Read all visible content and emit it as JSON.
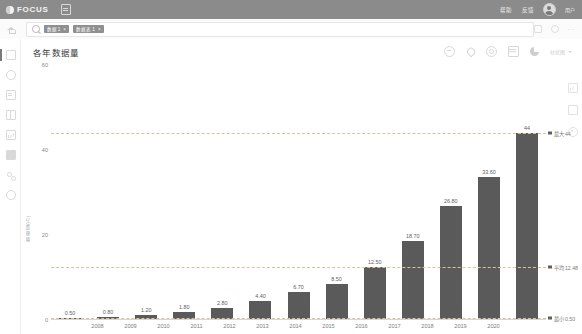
{
  "header": {
    "logo_text": "FOCUS",
    "logo_icon": "focus-circle-logo",
    "doc_icon": "document-icon",
    "links": [
      "帮助",
      "反馈"
    ],
    "user_name": "用户"
  },
  "subbar": {
    "home_icon": "home-icon",
    "search_icon": "search-icon",
    "search_placeholder": "搜索",
    "chips": [
      {
        "label": "数据 1",
        "close": "×"
      },
      {
        "label": "数据表 1",
        "close": "×"
      }
    ],
    "right_icons": [
      "square-icon",
      "circle-icon",
      "more-dots-icon"
    ]
  },
  "sidebar": {
    "items": [
      {
        "name": "sidebar-item-home",
        "icon": "square-icon",
        "active": true
      },
      {
        "name": "sidebar-item-circle",
        "icon": "circle-icon",
        "active": false
      },
      {
        "name": "sidebar-item-document",
        "icon": "document-icon",
        "active": false
      },
      {
        "name": "sidebar-item-grid",
        "icon": "grid-icon",
        "active": false
      },
      {
        "name": "sidebar-item-chart",
        "icon": "bar-chart-icon",
        "active": false
      },
      {
        "name": "sidebar-item-database",
        "icon": "database-icon",
        "active": false
      },
      {
        "name": "sidebar-item-share",
        "icon": "share-icon",
        "active": false
      },
      {
        "name": "sidebar-item-settings",
        "icon": "gear-icon",
        "active": false
      }
    ]
  },
  "card": {
    "title": "各年数据量",
    "tools": [
      {
        "name": "collapse-button",
        "icon": "minus-circle-icon"
      },
      {
        "name": "pin-button",
        "icon": "pin-icon"
      },
      {
        "name": "refresh-button",
        "icon": "refresh-icon"
      },
      {
        "name": "table-view-button",
        "icon": "table-icon"
      },
      {
        "name": "chart-type-button",
        "icon": "pie-chart-icon"
      }
    ],
    "type_selector_label": "柱状图",
    "right_rail": [
      {
        "name": "rail-chart-icon",
        "icon": "bar-chart-icon"
      },
      {
        "name": "rail-square-icon",
        "icon": "square-icon"
      },
      {
        "name": "rail-target-icon",
        "icon": "target-icon"
      }
    ]
  },
  "chart_data": {
    "type": "bar",
    "title": "各年数据量",
    "xlabel": "年份",
    "ylabel": "数据量(万)",
    "categories": [
      "2008",
      "2009",
      "2010",
      "2011",
      "2012",
      "2013",
      "2014",
      "2015",
      "2016",
      "2017",
      "2018",
      "2019",
      "2020"
    ],
    "values": [
      0.5,
      0.8,
      1.2,
      1.8,
      2.8,
      4.4,
      6.7,
      8.5,
      12.5,
      18.7,
      26.8,
      33.6,
      44
    ],
    "value_labels": [
      "0.50",
      "0.80",
      "1.20",
      "1.80",
      "2.80",
      "4.40",
      "6.70",
      "8.50",
      "12.50",
      "18.70",
      "26.80",
      "33.60",
      "44"
    ],
    "ylim": [
      0,
      60
    ],
    "yticks": [
      0,
      20,
      40,
      60
    ],
    "ytick_labels": [
      "0",
      "20",
      "40",
      "60"
    ],
    "grid": false,
    "bar_color": "#5a5a5a",
    "reference_lines": [
      {
        "name": "max",
        "label": "最大 44",
        "value": 44,
        "color": "#d8c49a"
      },
      {
        "name": "avg",
        "label": "平均 12.48",
        "value": 12.48,
        "color": "#d8c49a"
      },
      {
        "name": "min",
        "label": "最小 0.50",
        "value": 0.5,
        "color": "#d8c49a"
      }
    ],
    "legend_position": "right"
  }
}
